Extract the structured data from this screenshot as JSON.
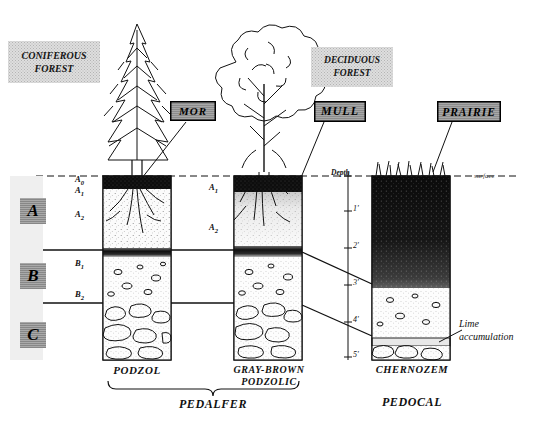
{
  "figure": {
    "surface_line_label": "surface"
  },
  "biomes": [
    {
      "name": "coniferous-forest",
      "line1": "CONIFEROUS",
      "line2": "FOREST"
    },
    {
      "name": "deciduous-forest",
      "line1": "DECIDUOUS",
      "line2": "FOREST"
    }
  ],
  "humus_tags": [
    {
      "name": "mor",
      "label": "MOR"
    },
    {
      "name": "mull",
      "label": "MULL"
    },
    {
      "name": "prairie",
      "label": "PRAIRIE"
    }
  ],
  "horizons": [
    {
      "key": "A",
      "label": "A"
    },
    {
      "key": "B",
      "label": "B"
    },
    {
      "key": "C",
      "label": "C"
    }
  ],
  "subhorizons_left": [
    {
      "label": "A",
      "sub": "0"
    },
    {
      "label": "A",
      "sub": "1"
    },
    {
      "label": "A",
      "sub": "2"
    },
    {
      "label": "B",
      "sub": "1"
    },
    {
      "label": "B",
      "sub": "2"
    }
  ],
  "subhorizons_middle": [
    {
      "label": "A",
      "sub": "1"
    },
    {
      "label": "A",
      "sub": "2"
    }
  ],
  "depth_scale": {
    "label": "Depth",
    "ticks": [
      "1'",
      "2'",
      "3'",
      "4'",
      "5'"
    ]
  },
  "profiles": [
    {
      "name": "podzol",
      "caption": "PODZOL"
    },
    {
      "name": "gray-brown-podzolic",
      "caption_line1": "GRAY-BROWN",
      "caption_line2": "PODZOLIC"
    },
    {
      "name": "chernozem",
      "caption": "CHERNOZEM"
    }
  ],
  "groups": [
    {
      "name": "pedalfer",
      "label": "PEDALFER"
    },
    {
      "name": "pedocal",
      "label": "PEDOCAL"
    }
  ],
  "annotations": [
    {
      "name": "lime-accumulation",
      "line1": "Lime",
      "line2": "accumulation"
    }
  ],
  "colors": {
    "ink": "#111111",
    "organic_dark": "#111111",
    "leached_light": "#f4f4f4",
    "label_gray": "#a8a8a8",
    "biome_gray": "#dedede"
  }
}
